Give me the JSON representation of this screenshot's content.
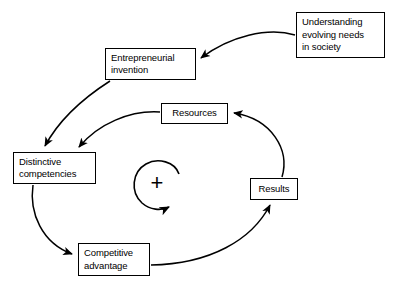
{
  "diagram": {
    "background_color": "#ffffff",
    "stroke_color": "#000000",
    "nodes": [
      {
        "id": "understanding",
        "label": "Understanding\nevolving needs\nin society",
        "name": "node-understanding"
      },
      {
        "id": "entrepreneurial",
        "label": "Entrepreneurial\ninvention",
        "name": "node-entrepreneurial"
      },
      {
        "id": "resources",
        "label": "Resources",
        "name": "node-resources"
      },
      {
        "id": "distinctive",
        "label": "Distinctive\ncompetencies",
        "name": "node-distinctive"
      },
      {
        "id": "results",
        "label": "Results",
        "name": "node-results"
      },
      {
        "id": "competitive",
        "label": "Competitive\nadvantage",
        "name": "node-competitive"
      }
    ],
    "loop_marker": {
      "symbol": "+",
      "rotation": "clockwise",
      "meaning": "reinforcing loop"
    },
    "edges": [
      {
        "from": "understanding",
        "to": "entrepreneurial"
      },
      {
        "from": "entrepreneurial",
        "to": "distinctive"
      },
      {
        "from": "resources",
        "to": "distinctive"
      },
      {
        "from": "distinctive",
        "to": "competitive"
      },
      {
        "from": "competitive",
        "to": "results"
      },
      {
        "from": "results",
        "to": "resources"
      }
    ]
  }
}
